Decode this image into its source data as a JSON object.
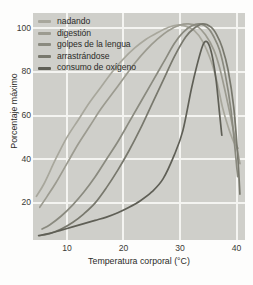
{
  "chart_data": {
    "type": "line",
    "title": "",
    "xlabel": "Temperatura corporal (°C)",
    "ylabel": "Porcentaje máximo",
    "xlim": [
      4,
      41.5
    ],
    "ylim": [
      3,
      107
    ],
    "xticks": [
      10,
      20,
      30,
      40
    ],
    "yticks": [
      20,
      40,
      60,
      80,
      100
    ],
    "grid": true,
    "legend_position": "top-left",
    "series": [
      {
        "name": "nadando",
        "color": "#a8a79c",
        "x": [
          4.6,
          6,
          8,
          10,
          12,
          14,
          16,
          18,
          20,
          22,
          24,
          26,
          28,
          29.5,
          31,
          32.5,
          34,
          35.5,
          36.5,
          37.5,
          38.5,
          39.5,
          40.3
        ],
        "y": [
          23,
          29,
          40,
          50,
          58,
          66,
          73,
          80,
          86,
          91,
          95,
          98,
          100.5,
          101.5,
          101,
          99,
          94,
          85,
          76,
          64,
          55,
          48,
          45
        ]
      },
      {
        "name": "digestión",
        "color": "#9c9b90",
        "x": [
          5.2,
          6.5,
          8,
          10,
          12,
          14,
          16,
          18,
          20,
          22,
          24,
          26,
          28,
          30,
          31.5,
          33,
          34.5,
          36,
          37,
          38,
          39,
          40,
          40.6
        ],
        "y": [
          18,
          23,
          29,
          38,
          47,
          55,
          63,
          70,
          77,
          84,
          90,
          95,
          99,
          101.5,
          102,
          101,
          97,
          90,
          82,
          71,
          59,
          46,
          38
        ]
      },
      {
        "name": "golpes de la lengua",
        "color": "#8a8a7f",
        "x": [
          5.6,
          7,
          9,
          11,
          13,
          15,
          17,
          19,
          21,
          23,
          25,
          27,
          29,
          30.5,
          32,
          33.5,
          35,
          36,
          37,
          38,
          39,
          39.8,
          40.2
        ],
        "y": [
          8,
          10,
          14,
          19,
          25,
          32,
          40,
          48,
          57,
          66,
          75,
          84,
          93,
          98,
          101,
          102,
          100,
          96,
          90,
          79,
          63,
          43,
          32
        ]
      },
      {
        "name": "arrastrándose",
        "color": "#78786d",
        "x": [
          5.2,
          7,
          9,
          11,
          13,
          15,
          17,
          19,
          21,
          23,
          25,
          27,
          29,
          31,
          32.5,
          34,
          35.5,
          36.5,
          37.5,
          38.5,
          39.5,
          40.2,
          40.6
        ],
        "y": [
          5,
          6,
          8,
          11,
          15,
          20,
          27,
          35,
          44,
          54,
          65,
          76,
          87,
          96,
          100,
          102,
          100.5,
          97,
          91,
          81,
          64,
          42,
          24
        ]
      },
      {
        "name": "consumo de oxígeno",
        "color": "#5f5f56",
        "x": [
          5,
          7,
          9,
          11,
          13,
          15,
          17,
          19,
          21,
          23,
          25,
          27,
          29,
          30.5,
          32,
          33,
          34,
          34.6,
          35.2,
          35.8,
          36.4,
          37,
          37.4
        ],
        "y": [
          5,
          6,
          7.5,
          9,
          10.5,
          12,
          13.5,
          15.5,
          18,
          21,
          25,
          31,
          42,
          53,
          72,
          83,
          92,
          94,
          92,
          86,
          76,
          61,
          51
        ]
      }
    ]
  },
  "legend": {
    "items": [
      {
        "label": "nadando"
      },
      {
        "label": "digestión"
      },
      {
        "label": "golpes de la lengua"
      },
      {
        "label": "arrastrándose"
      },
      {
        "label": "consumo de oxígeno"
      }
    ]
  },
  "axes": {
    "x_tick_labels": [
      "10",
      "20",
      "30",
      "40"
    ],
    "y_tick_labels": [
      "100",
      "80",
      "60",
      "40",
      "20"
    ],
    "x_title": "Temperatura corporal (°C)",
    "y_title": "Porcentaje máximo"
  },
  "colors": {
    "plot_background": "#cfcfca",
    "grid": "#f4f4f1",
    "page_background": "#fdfdfc",
    "text": "#2b2b28"
  }
}
